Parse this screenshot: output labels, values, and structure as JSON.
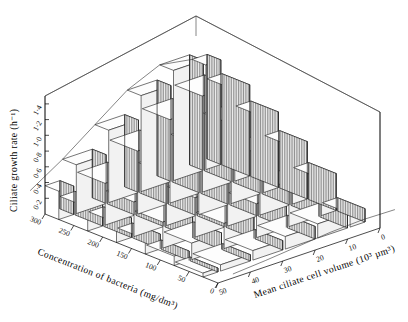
{
  "figure": {
    "kind": "3d-surface-plot",
    "background": "#ffffff",
    "line_color": "#1a1a1a",
    "fill_color": "#d8d8d8",
    "hatch": "vertical-lines"
  },
  "chart_data": {
    "type": "area",
    "render": "3d-staircase-surface",
    "title": "",
    "zlabel": "Ciliate growth rate (h⁻¹)",
    "xlabel": "Concentration of bacteria (mg/dm³)",
    "ylabel": "Mean ciliate cell volume (10³ µm³)",
    "zticks": [
      "0.2",
      "0.4",
      "0.6",
      "0.8",
      "1.0",
      "1.2",
      "1.4"
    ],
    "zlim": [
      0,
      1.5
    ],
    "xticks": [
      "300",
      "250",
      "200",
      "150",
      "100",
      "50",
      "0"
    ],
    "xlim": [
      0,
      300
    ],
    "yticks": [
      "50",
      "40",
      "30",
      "20",
      "10",
      "0"
    ],
    "ylim": [
      0,
      50
    ],
    "grid": false,
    "legend": "none",
    "x": [
      300,
      250,
      200,
      150,
      100,
      50
    ],
    "y": [
      50,
      40,
      30,
      20,
      10,
      0
    ],
    "series": [
      {
        "name": "volume 50",
        "values": [
          0.36,
          0.3,
          0.25,
          0.19,
          0.12,
          0.05
        ]
      },
      {
        "name": "volume 40",
        "values": [
          0.62,
          0.53,
          0.44,
          0.33,
          0.21,
          0.08
        ]
      },
      {
        "name": "volume 30",
        "values": [
          0.92,
          0.8,
          0.66,
          0.5,
          0.32,
          0.12
        ]
      },
      {
        "name": "volume 20",
        "values": [
          1.22,
          1.06,
          0.88,
          0.67,
          0.43,
          0.16
        ]
      },
      {
        "name": "volume 10",
        "values": [
          1.4,
          1.22,
          1.01,
          0.77,
          0.49,
          0.18
        ]
      },
      {
        "name": "volume 0",
        "values": [
          1.33,
          1.16,
          0.96,
          0.73,
          0.47,
          0.17
        ]
      }
    ],
    "peak_value": 1.4,
    "peak_at": {
      "bacteria": 300,
      "volume": 10
    }
  }
}
